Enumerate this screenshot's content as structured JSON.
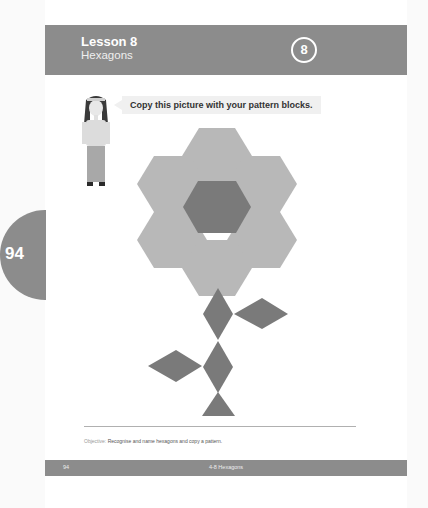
{
  "header": {
    "lesson_label": "Lesson 8",
    "lesson_topic": "Hexagons",
    "lesson_badge": "8"
  },
  "side_tab": {
    "page_number": "94"
  },
  "instruction": {
    "speech_bubble": "Copy this picture with your pattern blocks."
  },
  "figure": {
    "petals": {
      "shape": "hexagon",
      "count": 6,
      "color": "#b8b8b8"
    },
    "center": {
      "shape": "hexagon",
      "count": 1,
      "color": "#7a7a7a"
    },
    "stem": {
      "shape": "rhombus",
      "count": 4,
      "color": "#7a7a7a"
    },
    "base": {
      "shape": "triangle",
      "count": 1,
      "color": "#7a7a7a"
    }
  },
  "objective": {
    "label": "Objective:",
    "text": "Recognise and name hexagons and copy a pattern."
  },
  "footer": {
    "page_number": "94",
    "title": "4-8 Hexagons"
  },
  "colors": {
    "header_bg": "#8c8c8c",
    "petal": "#b8b8b8",
    "dark_block": "#7a7a7a"
  }
}
